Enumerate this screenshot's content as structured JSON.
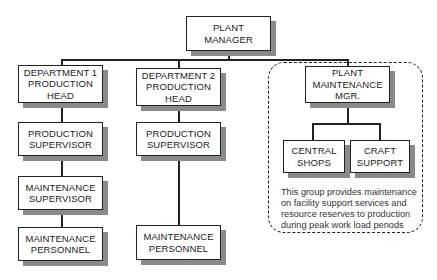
{
  "nodes": {
    "plant_manager": {
      "lines": [
        "PLANT",
        "MANAGER"
      ]
    },
    "dept1_head": {
      "lines": [
        "DEPARTMENT 1",
        "PRODUCTION",
        "HEAD"
      ]
    },
    "dept2_head": {
      "lines": [
        "DEPARTMENT 2",
        "PRODUCTION",
        "HEAD"
      ]
    },
    "plant_maint_mgr": {
      "lines": [
        "PLANT",
        "MAINTENANCE",
        "MGR."
      ]
    },
    "prod_sup1": {
      "lines": [
        "PRODUCTION",
        "SUPERVISOR"
      ]
    },
    "prod_sup2": {
      "lines": [
        "PRODUCTION",
        "SUPERVISOR"
      ]
    },
    "maint_sup": {
      "lines": [
        "MAINTENANCE",
        "SUPERVISOR"
      ]
    },
    "maint_pers1": {
      "lines": [
        "MAINTENANCE",
        "PERSONNEL"
      ]
    },
    "maint_pers2": {
      "lines": [
        "MAINTENANCE",
        "PERSONNEL"
      ]
    },
    "central_shops": {
      "lines": [
        "CENTRAL",
        "SHOPS"
      ]
    },
    "craft_support": {
      "lines": [
        "CRAFT",
        "SUPPORT"
      ]
    }
  },
  "note": {
    "lines": [
      "This group provides maintenance",
      "on facility support services and",
      "resource reserves to production",
      "during peak work load penods"
    ]
  },
  "colors": {
    "line": "#222222",
    "shadow": "#8a8a8a",
    "background": "#ffffff"
  }
}
